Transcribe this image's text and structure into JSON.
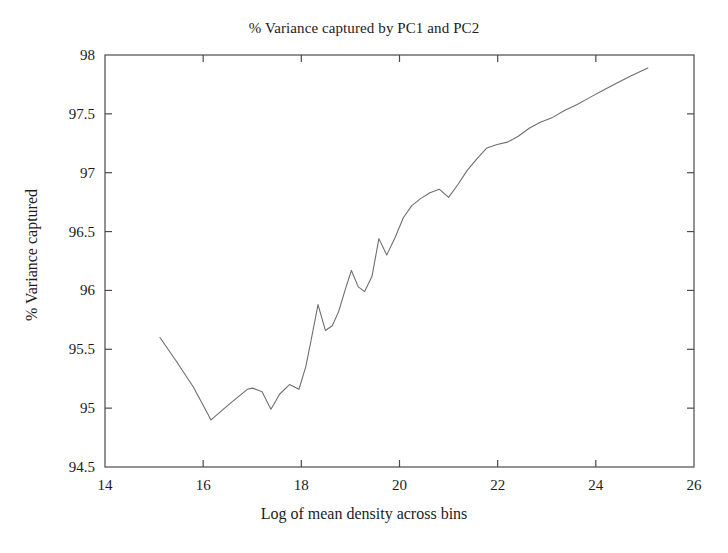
{
  "chart_data": {
    "type": "line",
    "title": "% Variance captured by PC1 and PC2",
    "xlabel": "Log of mean density across bins",
    "ylabel": "% Variance captured",
    "xlim": [
      14,
      26
    ],
    "ylim": [
      94.5,
      98
    ],
    "xticks": [
      14,
      16,
      18,
      20,
      22,
      24,
      26
    ],
    "xtick_labels": [
      "14",
      "16",
      "18",
      "20",
      "22",
      "24",
      "26"
    ],
    "yticks": [
      94.5,
      95,
      95.5,
      96,
      96.5,
      97,
      97.5,
      98
    ],
    "ytick_labels": [
      "94.5",
      "95",
      "95.5",
      "96",
      "96.5",
      "97",
      "97.5",
      "98"
    ],
    "grid": false,
    "legend": false,
    "line_color": "#6e6e6e",
    "axis_color": "#4a4a4a",
    "series": [
      {
        "name": "% Variance captured",
        "x": [
          15.12,
          15.45,
          15.8,
          16.16,
          16.55,
          16.9,
          17.01,
          17.2,
          17.38,
          17.56,
          17.76,
          17.95,
          18.09,
          18.21,
          18.34,
          18.49,
          18.63,
          18.76,
          18.89,
          19.02,
          19.16,
          19.29,
          19.44,
          19.58,
          19.74,
          19.91,
          20.08,
          20.25,
          20.43,
          20.62,
          20.81,
          21.0,
          21.19,
          21.38,
          21.58,
          21.78,
          21.99,
          22.2,
          22.42,
          22.65,
          22.88,
          23.12,
          23.37,
          23.62,
          23.88,
          24.15,
          24.42,
          24.7,
          25.06
        ],
        "y": [
          95.6,
          95.4,
          95.18,
          94.9,
          95.04,
          95.16,
          95.17,
          95.14,
          94.99,
          95.12,
          95.2,
          95.16,
          95.35,
          95.6,
          95.88,
          95.66,
          95.7,
          95.82,
          96.0,
          96.17,
          96.03,
          95.99,
          96.12,
          96.44,
          96.3,
          96.45,
          96.62,
          96.72,
          96.78,
          96.83,
          96.86,
          96.79,
          96.9,
          97.02,
          97.12,
          97.21,
          97.24,
          97.26,
          97.31,
          97.38,
          97.43,
          97.47,
          97.53,
          97.58,
          97.64,
          97.7,
          97.76,
          97.82,
          97.89
        ]
      }
    ]
  },
  "axes": {
    "title": "% Variance captured by PC1 and PC2",
    "x_axis_label": "Log of mean density across bins",
    "y_axis_label": "% Variance captured"
  }
}
